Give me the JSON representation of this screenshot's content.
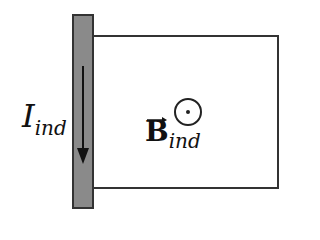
{
  "diagram": {
    "current_label": {
      "symbol": "I",
      "subscript": "ind"
    },
    "field_label": {
      "symbol": "B",
      "subscript": "ind",
      "vector": true
    },
    "field_direction_icon": "out-of-page-dot-circle",
    "current_direction": "down",
    "colors": {
      "bar_fill": "#8a8a8a",
      "wire": "#333333",
      "arrow": "#111111"
    }
  }
}
